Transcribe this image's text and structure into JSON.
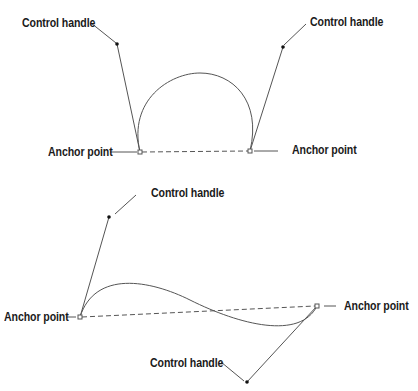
{
  "diagram": {
    "top": {
      "labels": {
        "control_left": "Control handle",
        "control_right": "Control handle",
        "anchor_left": "Anchor point",
        "anchor_right": "Anchor point"
      }
    },
    "bottom": {
      "labels": {
        "control_top": "Control handle",
        "control_bottom": "Control handle",
        "anchor_left": "Anchor point",
        "anchor_right": "Anchor point"
      }
    },
    "colors": {
      "line": "#555555",
      "text": "#1a1a1a",
      "background": "#ffffff"
    }
  }
}
